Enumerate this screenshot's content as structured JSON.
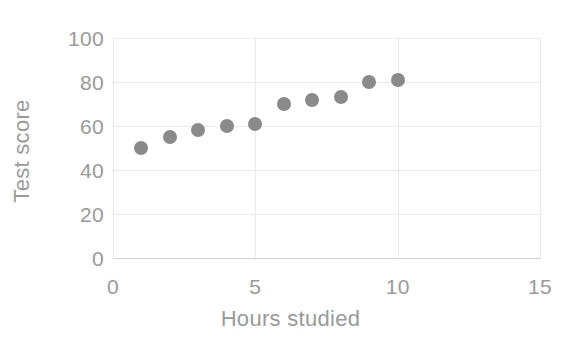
{
  "chart_data": {
    "type": "scatter",
    "title": "",
    "xlabel": "Hours studied",
    "ylabel": "Test score",
    "xlim": [
      0,
      15
    ],
    "ylim": [
      0,
      100
    ],
    "xticks": [
      "0",
      "5",
      "10",
      "15"
    ],
    "xtick_values": [
      0,
      5,
      10,
      15
    ],
    "yticks": [
      "0",
      "20",
      "40",
      "60",
      "80",
      "100"
    ],
    "ytick_values": [
      0,
      20,
      40,
      60,
      80,
      100
    ],
    "grid": true,
    "legend": null,
    "series": [
      {
        "name": "Test score",
        "marker": "circle",
        "color": "#8a8a8a",
        "x": [
          1,
          2,
          3,
          4,
          5,
          6,
          7,
          8,
          9,
          10
        ],
        "values": [
          50,
          55,
          58,
          60,
          61,
          70,
          72,
          73,
          80,
          81
        ],
        "points": [
          {
            "x": 1,
            "y": 50
          },
          {
            "x": 2,
            "y": 55
          },
          {
            "x": 3,
            "y": 58
          },
          {
            "x": 4,
            "y": 60
          },
          {
            "x": 5,
            "y": 61
          },
          {
            "x": 6,
            "y": 70
          },
          {
            "x": 7,
            "y": 72
          },
          {
            "x": 8,
            "y": 73
          },
          {
            "x": 9,
            "y": 80
          },
          {
            "x": 10,
            "y": 81
          }
        ]
      }
    ],
    "colors": {
      "marker": "#8a8a8a",
      "grid": "#e9e9e9",
      "axis": "#d2d2d2",
      "text": "#9a9a9a",
      "background": "#ffffff"
    }
  }
}
